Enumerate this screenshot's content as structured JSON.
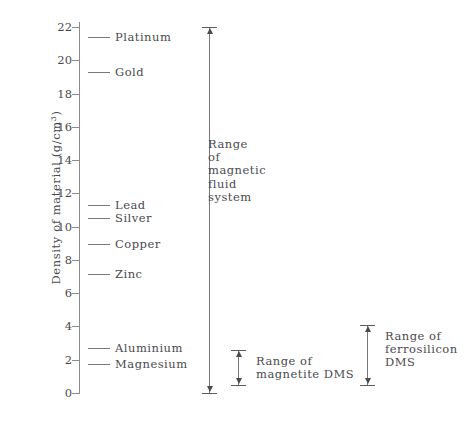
{
  "chart_data": {
    "type": "scatter",
    "title": "",
    "xlabel": "",
    "ylabel": "Density of material (g/cm3)",
    "ylabel_base": "Density of material (g/cm",
    "ylabel_sup": "3",
    "ylabel_tail": ")",
    "ylim": [
      0,
      23
    ],
    "grid": false,
    "legend": "none",
    "y_ticks": [
      {
        "value": 0,
        "label": "0"
      },
      {
        "value": 2,
        "label": "2"
      },
      {
        "value": 4,
        "label": "4"
      },
      {
        "value": 6,
        "label": "6"
      },
      {
        "value": 8,
        "label": "8"
      },
      {
        "value": 10,
        "label": "10"
      },
      {
        "value": 12,
        "label": "12"
      },
      {
        "value": 14,
        "label": "14"
      },
      {
        "value": 16,
        "label": "16"
      },
      {
        "value": 18,
        "label": "18"
      },
      {
        "value": 20,
        "label": "20"
      },
      {
        "value": 22,
        "label": "22"
      }
    ],
    "materials": [
      {
        "label": "Platinum",
        "value": 21.4
      },
      {
        "label": "Gold",
        "value": 19.3
      },
      {
        "label": "Lead",
        "value": 11.3
      },
      {
        "label": "Silver",
        "value": 10.5
      },
      {
        "label": "Copper",
        "value": 8.96
      },
      {
        "label": "Zinc",
        "value": 7.14
      },
      {
        "label": "Aluminium",
        "value": 2.7
      },
      {
        "label": "Magnesium",
        "value": 1.74
      }
    ],
    "ranges": [
      {
        "id": "magnetic-fluid-system",
        "label": "Range\nof\nmagnetic\nfluid\nsystem",
        "min": 0.0,
        "max": 22.0
      },
      {
        "id": "magnetite-dms",
        "label": "Range of\nmagnetite DMS",
        "min": 0.5,
        "max": 2.6
      },
      {
        "id": "ferrosilicon-dms",
        "label": "Range of\nferrosilicon\nDMS",
        "min": 0.5,
        "max": 4.1
      }
    ]
  }
}
